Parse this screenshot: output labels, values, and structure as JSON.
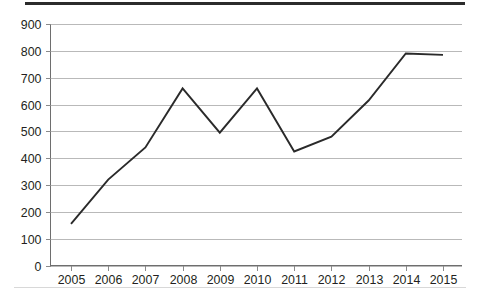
{
  "chart_data": {
    "type": "line",
    "title": "",
    "subtitle": "",
    "xlabel": "",
    "ylabel": "",
    "categories": [
      "2005",
      "2006",
      "2007",
      "2008",
      "2009",
      "2010",
      "2011",
      "2012",
      "2013",
      "2014",
      "2015"
    ],
    "x": [
      2005,
      2006,
      2007,
      2008,
      2009,
      2010,
      2011,
      2012,
      2013,
      2014,
      2015
    ],
    "values": [
      155,
      320,
      440,
      660,
      495,
      660,
      425,
      480,
      615,
      790,
      785
    ],
    "series": [
      {
        "name": "series-1",
        "values": [
          155,
          320,
          440,
          660,
          495,
          660,
          425,
          480,
          615,
          790,
          785
        ],
        "color": "#2a2a2a"
      }
    ],
    "ylim": [
      0,
      900
    ],
    "yticks": [
      0,
      100,
      200,
      300,
      400,
      500,
      600,
      700,
      800,
      900
    ],
    "ytick_labels": [
      "0",
      "100",
      "200",
      "300",
      "400",
      "500",
      "600",
      "700",
      "800",
      "900"
    ],
    "xtick_labels": [
      "2005",
      "2006",
      "2007",
      "2008",
      "2009",
      "2010",
      "2011",
      "2012",
      "2013",
      "2014",
      "2015"
    ],
    "grid": "horizontal",
    "grid_color": "#b9b9b9",
    "legend": null,
    "legend_position": "none",
    "annotations": [],
    "background_color": "#ffffff",
    "axis_color": "#6e6e6e",
    "text_color": "#231f20"
  },
  "decorations": {
    "top_rule_color": "#2b2b2b",
    "bottom_rule_color": "#d8d8d8"
  }
}
